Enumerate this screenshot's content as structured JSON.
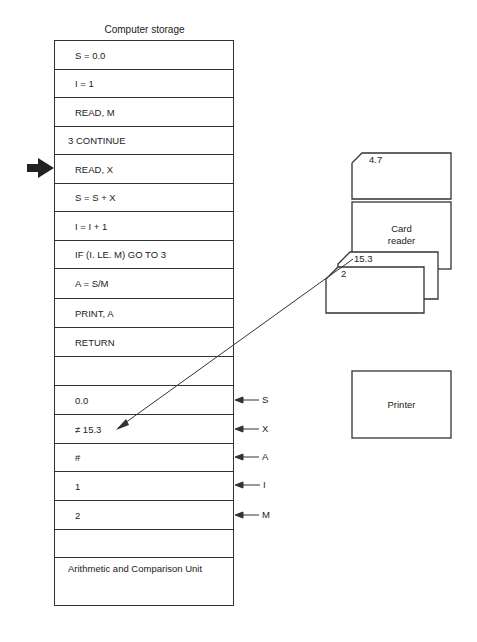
{
  "storage": {
    "title": "Computer storage",
    "instructions": [
      "S = 0.0",
      "I = 1",
      "READ, M",
      "3 CONTINUE",
      "READ, X",
      "S = S + X",
      "I = I + 1",
      "IF (I. LE. M) GO TO 3",
      "A = S/M",
      "PRINT, A",
      "RETURN",
      ""
    ],
    "current_instruction_index": 4,
    "variables": [
      {
        "value": "0.0",
        "name": "S"
      },
      {
        "value": "≠ 15.3",
        "name": "X"
      },
      {
        "value": "#",
        "name": "A"
      },
      {
        "value": "1",
        "name": "I"
      },
      {
        "value": "2",
        "name": "M"
      },
      {
        "value": "",
        "name": ""
      }
    ],
    "arithmetic_unit_label": "Arithmetic and Comparison Unit"
  },
  "devices": {
    "top_card_value": "4.7",
    "card_reader_label_line1": "Card",
    "card_reader_label_line2": "reader",
    "back_card_value": "15.3",
    "front_card_value": "2",
    "printer_label": "Printer"
  },
  "icons": {
    "current_pointer": "arrow-right-icon",
    "variable_pointer": "arrow-left-icon",
    "data_flow": "arrow-line-icon"
  },
  "colors": {
    "line": "#333333",
    "text": "#222222",
    "background": "#ffffff"
  }
}
